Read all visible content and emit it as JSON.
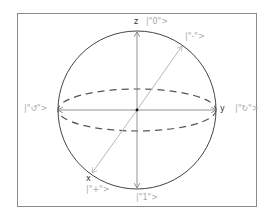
{
  "diagram": {
    "colors": {
      "frame": "#8a8a8a",
      "sphere": "#444444",
      "axis": "#777777",
      "diag": "#b8b8b8",
      "dashed": "#555555",
      "state_label": "#a8a8a8",
      "axis_label": "#333333"
    },
    "axes": {
      "z": "z",
      "y": "y",
      "x": "x"
    },
    "states": {
      "top": "|\"0\">",
      "bottom": "|\"1\">",
      "left": "|\"↺\">",
      "right": "|\"↻\">",
      "upper_right": "|\"-\">",
      "lower_left": "|\"+\">"
    }
  }
}
